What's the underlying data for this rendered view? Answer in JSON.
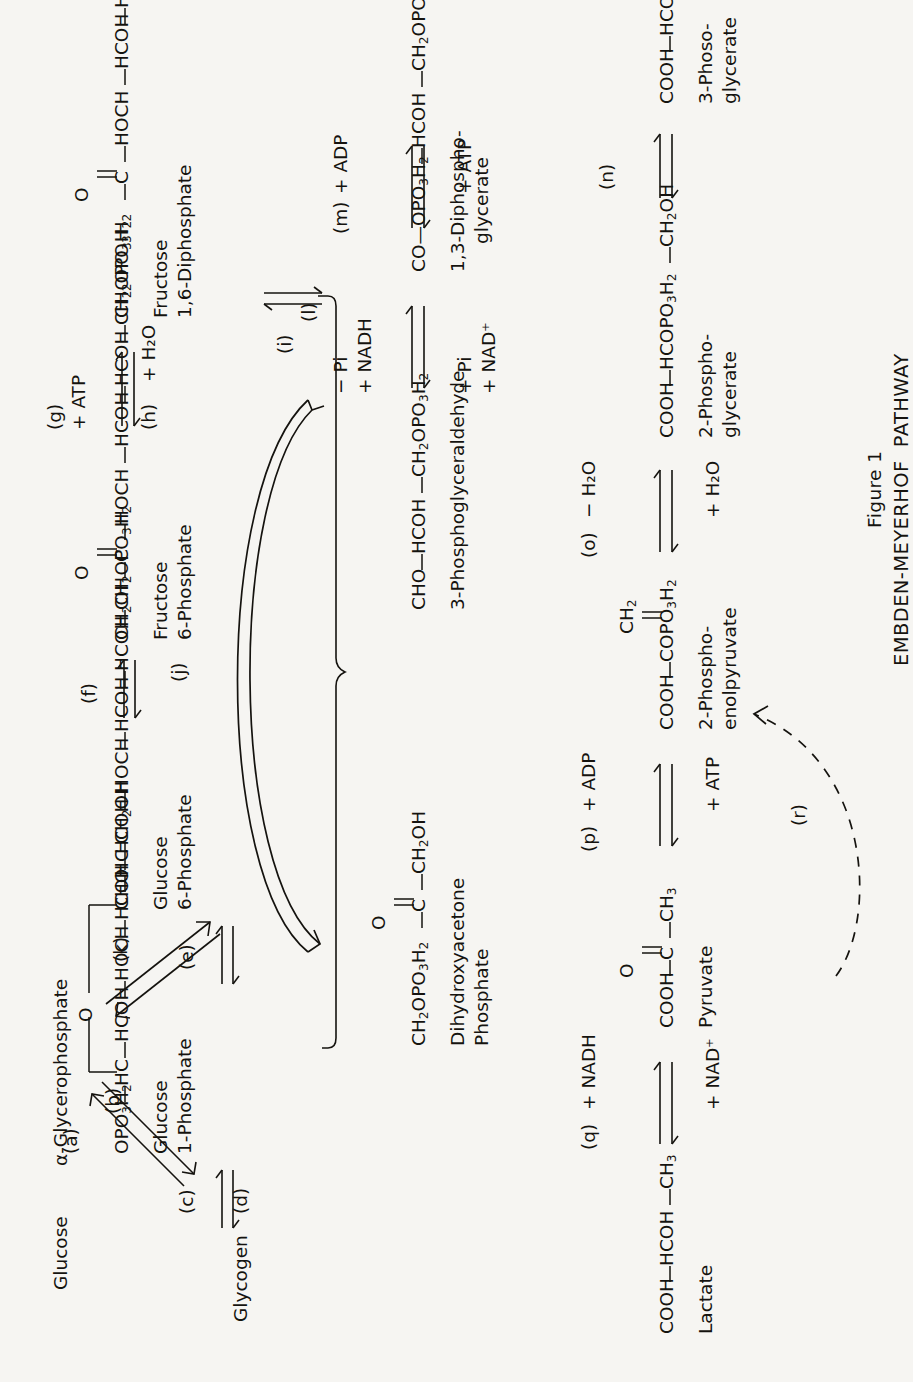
{
  "figure": {
    "number": "Figure 1",
    "title": "EMBDEN-MEYERHOF  PATHWAY"
  },
  "compounds": {
    "glycogen": {
      "name": "Glycogen",
      "formula_lines": []
    },
    "glucose_1p": {
      "name_line1": "Glucose",
      "name_line2": "1-Phosphate",
      "groups": [
        "OPO₃H₂",
        "HC",
        "HCOH",
        "HOCH",
        "HCOH",
        "HC",
        "CH₂OH"
      ]
    },
    "glucose": {
      "name": "Glucose"
    },
    "glucose_6p": {
      "name_line1": "Glucose",
      "name_line2": "6-Phosphate",
      "groups": [
        "CHO",
        "HCOH",
        "HOCH",
        "HCOH",
        "HCOH",
        "CH₂OPO₃H₂"
      ]
    },
    "fructose_6p": {
      "name_line1": "Fructose",
      "name_line2": "6-Phosphate",
      "groups": [
        "CH₂OH",
        "C=O",
        "HOCH",
        "HCOH",
        "HCOH",
        "CH₂OPO₃H₂"
      ]
    },
    "fructose_16dp": {
      "name_line1": "Fructose",
      "name_line2": "1,6-Diphosphate",
      "groups": [
        "CH₂OPO₃H₂",
        "C=O",
        "HOCH",
        "HCOH",
        "HCOH",
        "CH₂OPO₃H₂"
      ]
    },
    "dhap": {
      "name_line1": "Dihydroxyacetone",
      "name_line2": "Phosphate",
      "groups": [
        "CH₂OPO₃H₂",
        "C=O",
        "CH₂OH"
      ]
    },
    "g3p": {
      "name_line1": "3-Phosphoglyceraldehyde",
      "name_line2": "",
      "groups": [
        "CHO",
        "HCOH",
        "CH₂OPO₃H₂"
      ]
    },
    "dpg": {
      "name_line1": "1,3-Diphospho-",
      "name_line2": "glycerate",
      "groups": [
        "CO—OPO₃H₂",
        "HCOH",
        "CH₂OPO₃H₂"
      ]
    },
    "pg3": {
      "name_line1": "3-Phoso-",
      "name_line2": "glycerate",
      "groups": [
        "COOH",
        "HCOH",
        "CH₂OPO₃H₂"
      ]
    },
    "pg2": {
      "name_line1": "2-Phospho-",
      "name_line2": "glycerate",
      "groups": [
        "COOH",
        "HCOPO₃H₂",
        "CH₂OH"
      ]
    },
    "pep": {
      "name_line1": "2-Phospho-",
      "name_line2": "enolpyruvate",
      "groups": [
        "COOH",
        "COPO₃H₂",
        "CH₂"
      ]
    },
    "pyruvate": {
      "name_line1": "Pyruvate",
      "name_line2": "",
      "groups": [
        "COOH",
        "C=O",
        "CH₃"
      ]
    },
    "lactate": {
      "name_line1": "Lactate",
      "name_line2": "",
      "groups": [
        "COOH",
        "HCOH",
        "CH₃"
      ]
    },
    "glycerophosphate": {
      "name": "α-Glycerophosphate"
    }
  },
  "reactions": {
    "a": {
      "label": "(a)"
    },
    "b": {
      "label": "(b)"
    },
    "c": {
      "label": "(c)"
    },
    "d": {
      "label": "(d)"
    },
    "e": {
      "label": "(e)"
    },
    "f": {
      "label": "(f)"
    },
    "g": {
      "label": "(g)",
      "top": "+ ATP"
    },
    "h": {
      "label": "(h)",
      "bottom": "+ H₂O"
    },
    "i": {
      "label": "(i)"
    },
    "j": {
      "label": "(j)"
    },
    "k": {
      "label": "(k)"
    },
    "l": {
      "label": "(l)",
      "top1": "− Pi",
      "top2": "+ NADH",
      "bottom1": "+ Pi",
      "bottom2": "+ NAD⁺"
    },
    "m": {
      "label": "(m)",
      "top": "+ ADP",
      "bottom": "+ ATP"
    },
    "n": {
      "label": "(n)"
    },
    "o": {
      "label": "(o)",
      "top": "− H₂O",
      "bottom": "+ H₂O"
    },
    "p": {
      "label": "(p)",
      "top": "+ ADP",
      "bottom": "+ ATP"
    },
    "q": {
      "label": "(q)",
      "top": "+ NADH",
      "bottom": "+ NAD⁺"
    },
    "r": {
      "label": "(r)"
    }
  },
  "colors": {
    "ink": "#15130f",
    "paper": "#f6f5f2"
  }
}
